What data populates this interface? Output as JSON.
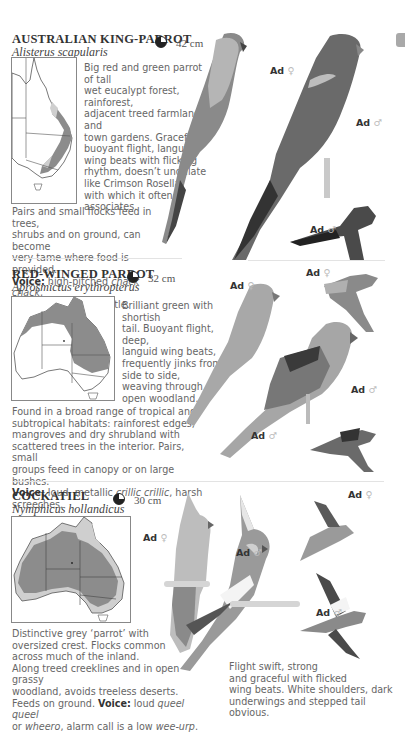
{
  "page_tab": {
    "color": "#a9a9a9"
  },
  "species": [
    {
      "name": "AUSTRALIAN KING-PARROT",
      "scientific": "Alisterus scapularis",
      "size": "42 cm",
      "description_lines": [
        "Big red and green parrot of tall",
        "wet eucalypt forest, rainforest,",
        "adjacent treed farmland and",
        "town gardens. Graceful,",
        "buoyant flight, languid",
        "wing beats with flicking",
        "rhythm, doesn’t undulate",
        "like Crimson Rosella",
        "with which it often",
        "associates."
      ],
      "habitat_lines": [
        "Pairs and small flocks feed in trees,",
        "shrubs and on ground, can become",
        "very tame where food is provided."
      ],
      "voice_label": "Voice:",
      "voice_text_pre": " high-pitched ",
      "voice_italic": "chack chack",
      "voice_text_post": ",",
      "voice_line2": "also single clear whistle.",
      "labels": [
        {
          "text": "Ad",
          "sex": "♀"
        },
        {
          "text": "Ad",
          "sex": "♂"
        },
        {
          "text": "Ad",
          "sex": "♂"
        }
      ]
    },
    {
      "name": "RED-WINGED PARROT",
      "scientific": "Aprosmictus erythropterus",
      "size": "32 cm",
      "description_lines": [
        "Brilliant green with shortish",
        "tail. Buoyant flight, deep,",
        "languid wing beats,",
        "frequently jinks from",
        "side to side,",
        "weaving through",
        "open woodland."
      ],
      "habitat_lines": [
        "Found in a broad range of tropical and",
        "subtropical habitats: rainforest edges,",
        "mangroves and dry shrubland with",
        "scattered trees in the interior. Pairs, small",
        "groups feed in canopy or on large bushes."
      ],
      "voice_label": "Voice:",
      "voice_text_pre": " loud, metallic ",
      "voice_italic": "crillic crillic",
      "voice_text_post": ", harsh",
      "voice_line2": "screeches.",
      "labels": [
        {
          "text": "Ad",
          "sex": "♀"
        },
        {
          "text": "Ad",
          "sex": "♀"
        },
        {
          "text": "Ad",
          "sex": "♂"
        },
        {
          "text": "Ad",
          "sex": "♂"
        }
      ]
    },
    {
      "name": "COCKATIEL",
      "scientific": "Nymphicus hollandicus",
      "size": "30 cm",
      "description_lines": [
        "Distinctive grey ‘parrot’ with",
        "oversized crest. Flocks common",
        "across much of the inland.",
        "Along treed creeklines and in open grassy",
        "woodland, avoids treeless deserts."
      ],
      "voice_pre": "Feeds on ground. ",
      "voice_label": "Voice:",
      "voice_text_pre": " loud ",
      "voice_italic": "queel queel",
      "voice_line2_pre": "or ",
      "voice_line2_italic": "wheero",
      "voice_line2_mid": ", alarm call is a low ",
      "voice_line2_italic2": "wee-urp",
      "voice_line2_post": ".",
      "flight_lines": [
        "Flight swift, strong",
        "and graceful with flicked",
        "wing beats. White shoulders, dark",
        "underwings and stepped tail obvious."
      ],
      "labels": [
        {
          "text": "Ad",
          "sex": "♀"
        },
        {
          "text": "Ad",
          "sex": "♂"
        },
        {
          "text": "Ad",
          "sex": "♀"
        },
        {
          "text": "Ad",
          "sex": "♂"
        }
      ]
    }
  ]
}
